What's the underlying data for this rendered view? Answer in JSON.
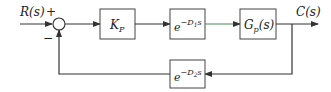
{
  "diagram": {
    "type": "feedback-control-block-diagram",
    "input": {
      "label": "R(s)",
      "sign": "+"
    },
    "summing_junction": {
      "plus_sign": "+",
      "minus_sign": "−"
    },
    "forward_blocks": [
      {
        "id": "controller",
        "base": "K",
        "sub": "P"
      },
      {
        "id": "forward-delay",
        "base": "e",
        "sup": "−D",
        "sup_sub": "1",
        "sup_tail": "s"
      },
      {
        "id": "plant",
        "base": "G",
        "sub": "p",
        "tail": "(s)"
      }
    ],
    "feedback_block": {
      "id": "feedback-delay",
      "base": "e",
      "sup": "−D",
      "sup_sub": "2",
      "sup_tail": "s"
    },
    "output": {
      "label": "C(s)"
    },
    "colors": {
      "line": "#333333",
      "input_line": "#8a8a3a",
      "green_segment": "#4a9a4a",
      "text": "#222222"
    }
  }
}
